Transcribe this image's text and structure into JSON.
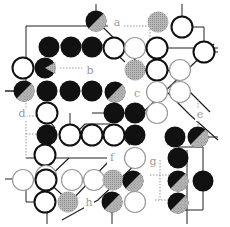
{
  "diagram": {
    "labels": [
      {
        "text": "a",
        "x": 117,
        "y": 26
      },
      {
        "text": "b",
        "x": 90,
        "y": 74
      },
      {
        "text": "c",
        "x": 137,
        "y": 97
      },
      {
        "text": "d",
        "x": 22,
        "y": 117
      },
      {
        "text": "e",
        "x": 200,
        "y": 118
      },
      {
        "text": "f",
        "x": 112,
        "y": 161
      },
      {
        "text": "g",
        "x": 153,
        "y": 165
      },
      {
        "text": "h",
        "x": 89,
        "y": 206
      }
    ],
    "colors": {
      "black": "#111111",
      "white": "#ffffff",
      "grey": "#a8a8a8",
      "line": "#222222",
      "dotted": "#9a9a9a"
    },
    "stones": [
      {
        "type": "black-half-grey",
        "x": 96,
        "y": 21
      },
      {
        "type": "grey",
        "x": 158,
        "y": 22
      },
      {
        "type": "white",
        "x": 182,
        "y": 27
      },
      {
        "type": "black",
        "x": 49,
        "y": 47
      },
      {
        "type": "black",
        "x": 71,
        "y": 47
      },
      {
        "type": "black",
        "x": 92,
        "y": 47
      },
      {
        "type": "white",
        "x": 114,
        "y": 48
      },
      {
        "type": "white-thin",
        "x": 135,
        "y": 48
      },
      {
        "type": "white",
        "x": 157,
        "y": 48
      },
      {
        "type": "white",
        "x": 204,
        "y": 52
      },
      {
        "type": "white",
        "x": 23,
        "y": 68
      },
      {
        "type": "black-notch",
        "x": 45,
        "y": 68
      },
      {
        "type": "grey",
        "x": 135,
        "y": 70
      },
      {
        "type": "white",
        "x": 157,
        "y": 70
      },
      {
        "type": "white-thin",
        "x": 180,
        "y": 70
      },
      {
        "type": "black-half-grey",
        "x": 24,
        "y": 91
      },
      {
        "type": "black",
        "x": 47,
        "y": 91
      },
      {
        "type": "black",
        "x": 70,
        "y": 91
      },
      {
        "type": "black",
        "x": 92,
        "y": 91
      },
      {
        "type": "black-half-grey",
        "x": 115,
        "y": 92
      },
      {
        "type": "white-thin",
        "x": 157,
        "y": 92
      },
      {
        "type": "white-thin",
        "x": 180,
        "y": 92
      },
      {
        "type": "white",
        "x": 47,
        "y": 113
      },
      {
        "type": "black",
        "x": 114,
        "y": 113
      },
      {
        "type": "black",
        "x": 135,
        "y": 113
      },
      {
        "type": "white-thin",
        "x": 157,
        "y": 113
      },
      {
        "type": "black",
        "x": 47,
        "y": 135
      },
      {
        "type": "white",
        "x": 70,
        "y": 135
      },
      {
        "type": "white",
        "x": 92,
        "y": 135
      },
      {
        "type": "white",
        "x": 114,
        "y": 135
      },
      {
        "type": "black",
        "x": 135,
        "y": 135
      },
      {
        "type": "black",
        "x": 175,
        "y": 137
      },
      {
        "type": "black-half-grey",
        "x": 198,
        "y": 137
      },
      {
        "type": "white",
        "x": 45,
        "y": 155
      },
      {
        "type": "white-thin",
        "x": 135,
        "y": 158
      },
      {
        "type": "black",
        "x": 178,
        "y": 158
      },
      {
        "type": "white-thin",
        "x": 46,
        "y": 176
      },
      {
        "type": "white-thin",
        "x": 23,
        "y": 180
      },
      {
        "type": "white",
        "x": 46,
        "y": 180
      },
      {
        "type": "white-thin",
        "x": 72,
        "y": 180
      },
      {
        "type": "white-thin",
        "x": 94,
        "y": 180
      },
      {
        "type": "grey",
        "x": 113,
        "y": 180
      },
      {
        "type": "black-half-grey",
        "x": 133,
        "y": 181
      },
      {
        "type": "black",
        "x": 203,
        "y": 181
      },
      {
        "type": "black-half-grey",
        "x": 178,
        "y": 181
      },
      {
        "type": "white",
        "x": 45,
        "y": 202
      },
      {
        "type": "grey",
        "x": 68,
        "y": 202
      },
      {
        "type": "black-half-grey",
        "x": 112,
        "y": 202
      },
      {
        "type": "white-thin",
        "x": 135,
        "y": 202
      },
      {
        "type": "black-half-grey",
        "x": 178,
        "y": 203
      }
    ]
  }
}
